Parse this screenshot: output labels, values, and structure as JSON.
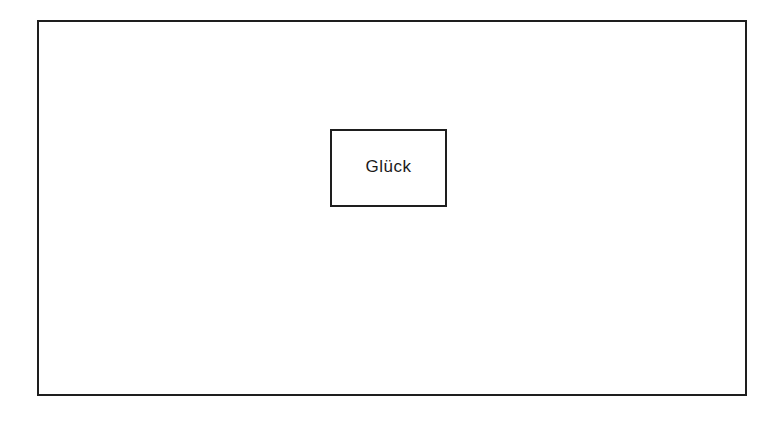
{
  "diagram": {
    "outer_frame": {
      "label": ""
    },
    "nodes": [
      {
        "label": "Glück"
      }
    ]
  },
  "colors": {
    "line": "#1e1e1e",
    "text": "#1a1a1a",
    "background": "#ffffff"
  }
}
